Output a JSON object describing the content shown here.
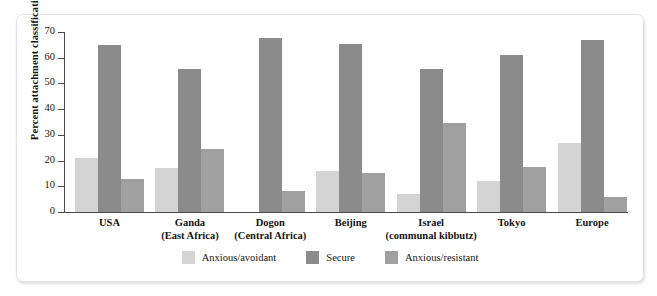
{
  "chart_data": {
    "type": "bar",
    "title": "",
    "xlabel": "",
    "ylabel": "Percent attachment classification",
    "ylim": [
      0,
      70
    ],
    "ytick_step": 10,
    "yticks": [
      70,
      60,
      50,
      40,
      30,
      20,
      10,
      0
    ],
    "grid": false,
    "legend_position": "bottom-center",
    "categories": [
      "USA",
      "Ganda\n(East Africa)",
      "Dogon\n(Central Africa)",
      "Beijing",
      "Israel\n(communal kibbutz)",
      "Tokyo",
      "Europe"
    ],
    "category_lines": [
      {
        "line1": "USA",
        "line2": ""
      },
      {
        "line1": "Ganda",
        "line2": "(East Africa)"
      },
      {
        "line1": "Dogon",
        "line2": "(Central Africa)"
      },
      {
        "line1": "Beijing",
        "line2": ""
      },
      {
        "line1": "Israel",
        "line2": "(communal kibbutz)"
      },
      {
        "line1": "Tokyo",
        "line2": ""
      },
      {
        "line1": "Europe",
        "line2": ""
      }
    ],
    "series": [
      {
        "name": "Anxious/avoidant",
        "color": "#d4d4d4",
        "values": [
          21,
          17,
          0,
          16,
          7,
          12,
          27
        ]
      },
      {
        "name": "Secure",
        "color": "#8b8b8b",
        "values": [
          65,
          55.5,
          67.5,
          65.5,
          55.5,
          61,
          67
        ]
      },
      {
        "name": "Anxious/resistant",
        "color": "#a0a0a0",
        "values": [
          13,
          24.5,
          8,
          15,
          34.5,
          17.5,
          6
        ]
      }
    ]
  },
  "legend": {
    "items": [
      {
        "label": "Anxious/avoidant",
        "color": "#d4d4d4"
      },
      {
        "label": "Secure",
        "color": "#8b8b8b"
      },
      {
        "label": "Anxious/resistant",
        "color": "#a0a0a0"
      }
    ]
  },
  "axis": {
    "y_title": "Percent attachment classification",
    "y_tick_labels": [
      "70",
      "60",
      "50",
      "40",
      "30",
      "20",
      "10",
      "0"
    ]
  }
}
